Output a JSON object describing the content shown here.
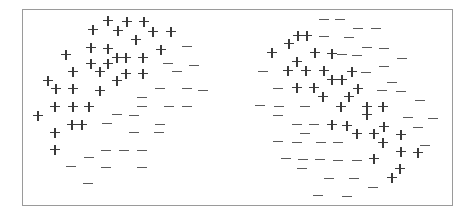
{
  "figure": {
    "frame": {
      "x": 22,
      "y": 9,
      "width": 431,
      "height": 197
    },
    "colors": {
      "border": "#9a9a9a",
      "plus": "#3a3a3a",
      "minus": "#5a5a5a"
    },
    "panels": [
      {
        "name": "left-cluster",
        "description": "Positive and negative examples separable by a roughly linear boundary",
        "points": [
          {
            "x": 108,
            "y": 21,
            "label": "+"
          },
          {
            "x": 127,
            "y": 22,
            "label": "+"
          },
          {
            "x": 144,
            "y": 22,
            "label": "+"
          },
          {
            "x": 93,
            "y": 30,
            "label": "+"
          },
          {
            "x": 118,
            "y": 31,
            "label": "+"
          },
          {
            "x": 153,
            "y": 32,
            "label": "+"
          },
          {
            "x": 171,
            "y": 32,
            "label": "+"
          },
          {
            "x": 136,
            "y": 40,
            "label": "+"
          },
          {
            "x": 91,
            "y": 48,
            "label": "+"
          },
          {
            "x": 108,
            "y": 49,
            "label": "+"
          },
          {
            "x": 161,
            "y": 50,
            "label": "+"
          },
          {
            "x": 66,
            "y": 55,
            "label": "+"
          },
          {
            "x": 117,
            "y": 58,
            "label": "+"
          },
          {
            "x": 126,
            "y": 58,
            "label": "+"
          },
          {
            "x": 143,
            "y": 58,
            "label": "+"
          },
          {
            "x": 91,
            "y": 64,
            "label": "+"
          },
          {
            "x": 108,
            "y": 64,
            "label": "+"
          },
          {
            "x": 73,
            "y": 72,
            "label": "+"
          },
          {
            "x": 100,
            "y": 72,
            "label": "+"
          },
          {
            "x": 126,
            "y": 74,
            "label": "+"
          },
          {
            "x": 143,
            "y": 74,
            "label": "+"
          },
          {
            "x": 48,
            "y": 81,
            "label": "+"
          },
          {
            "x": 117,
            "y": 81,
            "label": "+"
          },
          {
            "x": 56,
            "y": 89,
            "label": "+"
          },
          {
            "x": 73,
            "y": 89,
            "label": "+"
          },
          {
            "x": 100,
            "y": 91,
            "label": "+"
          },
          {
            "x": 55,
            "y": 107,
            "label": "+"
          },
          {
            "x": 73,
            "y": 107,
            "label": "+"
          },
          {
            "x": 89,
            "y": 107,
            "label": "+"
          },
          {
            "x": 38,
            "y": 116,
            "label": "+"
          },
          {
            "x": 72,
            "y": 125,
            "label": "+"
          },
          {
            "x": 82,
            "y": 125,
            "label": "+"
          },
          {
            "x": 55,
            "y": 133,
            "label": "+"
          },
          {
            "x": 55,
            "y": 150,
            "label": "+"
          },
          {
            "x": 187,
            "y": 47,
            "label": "-"
          },
          {
            "x": 168,
            "y": 64,
            "label": "-"
          },
          {
            "x": 194,
            "y": 66,
            "label": "-"
          },
          {
            "x": 177,
            "y": 72,
            "label": "-"
          },
          {
            "x": 160,
            "y": 89,
            "label": "-"
          },
          {
            "x": 187,
            "y": 89,
            "label": "-"
          },
          {
            "x": 203,
            "y": 91,
            "label": "-"
          },
          {
            "x": 142,
            "y": 98,
            "label": "-"
          },
          {
            "x": 142,
            "y": 107,
            "label": "-"
          },
          {
            "x": 169,
            "y": 107,
            "label": "-"
          },
          {
            "x": 187,
            "y": 107,
            "label": "-"
          },
          {
            "x": 117,
            "y": 115,
            "label": "-"
          },
          {
            "x": 134,
            "y": 116,
            "label": "-"
          },
          {
            "x": 107,
            "y": 124,
            "label": "-"
          },
          {
            "x": 160,
            "y": 125,
            "label": "-"
          },
          {
            "x": 134,
            "y": 133,
            "label": "-"
          },
          {
            "x": 159,
            "y": 133,
            "label": "-"
          },
          {
            "x": 106,
            "y": 151,
            "label": "-"
          },
          {
            "x": 124,
            "y": 151,
            "label": "-"
          },
          {
            "x": 142,
            "y": 151,
            "label": "-"
          },
          {
            "x": 89,
            "y": 158,
            "label": "-"
          },
          {
            "x": 71,
            "y": 167,
            "label": "-"
          },
          {
            "x": 106,
            "y": 168,
            "label": "-"
          },
          {
            "x": 142,
            "y": 168,
            "label": "-"
          },
          {
            "x": 88,
            "y": 184,
            "label": "-"
          }
        ]
      },
      {
        "name": "right-cluster",
        "description": "Positive and negative examples interleaved, not linearly separable",
        "points": [
          {
            "x": 324,
            "y": 20,
            "label": "-"
          },
          {
            "x": 340,
            "y": 20,
            "label": "-"
          },
          {
            "x": 358,
            "y": 29,
            "label": "-"
          },
          {
            "x": 376,
            "y": 29,
            "label": "-"
          },
          {
            "x": 324,
            "y": 37,
            "label": "-"
          },
          {
            "x": 349,
            "y": 38,
            "label": "-"
          },
          {
            "x": 367,
            "y": 48,
            "label": "-"
          },
          {
            "x": 384,
            "y": 49,
            "label": "-"
          },
          {
            "x": 342,
            "y": 55,
            "label": "-"
          },
          {
            "x": 357,
            "y": 56,
            "label": "-"
          },
          {
            "x": 402,
            "y": 59,
            "label": "-"
          },
          {
            "x": 263,
            "y": 72,
            "label": "-"
          },
          {
            "x": 384,
            "y": 67,
            "label": "-"
          },
          {
            "x": 366,
            "y": 73,
            "label": "-"
          },
          {
            "x": 392,
            "y": 83,
            "label": "-"
          },
          {
            "x": 278,
            "y": 89,
            "label": "-"
          },
          {
            "x": 382,
            "y": 91,
            "label": "-"
          },
          {
            "x": 401,
            "y": 92,
            "label": "-"
          },
          {
            "x": 420,
            "y": 101,
            "label": "-"
          },
          {
            "x": 260,
            "y": 106,
            "label": "-"
          },
          {
            "x": 279,
            "y": 107,
            "label": "-"
          },
          {
            "x": 305,
            "y": 107,
            "label": "-"
          },
          {
            "x": 278,
            "y": 116,
            "label": "-"
          },
          {
            "x": 408,
            "y": 118,
            "label": "-"
          },
          {
            "x": 433,
            "y": 119,
            "label": "-"
          },
          {
            "x": 297,
            "y": 125,
            "label": "-"
          },
          {
            "x": 314,
            "y": 125,
            "label": "-"
          },
          {
            "x": 418,
            "y": 128,
            "label": "-"
          },
          {
            "x": 305,
            "y": 134,
            "label": "-"
          },
          {
            "x": 278,
            "y": 142,
            "label": "-"
          },
          {
            "x": 297,
            "y": 143,
            "label": "-"
          },
          {
            "x": 321,
            "y": 143,
            "label": "-"
          },
          {
            "x": 338,
            "y": 143,
            "label": "-"
          },
          {
            "x": 425,
            "y": 146,
            "label": "-"
          },
          {
            "x": 286,
            "y": 159,
            "label": "-"
          },
          {
            "x": 303,
            "y": 160,
            "label": "-"
          },
          {
            "x": 320,
            "y": 160,
            "label": "-"
          },
          {
            "x": 338,
            "y": 161,
            "label": "-"
          },
          {
            "x": 357,
            "y": 161,
            "label": "-"
          },
          {
            "x": 302,
            "y": 169,
            "label": "-"
          },
          {
            "x": 329,
            "y": 179,
            "label": "-"
          },
          {
            "x": 354,
            "y": 179,
            "label": "-"
          },
          {
            "x": 373,
            "y": 188,
            "label": "-"
          },
          {
            "x": 318,
            "y": 196,
            "label": "-"
          },
          {
            "x": 347,
            "y": 197,
            "label": "-"
          },
          {
            "x": 298,
            "y": 36,
            "label": "+"
          },
          {
            "x": 307,
            "y": 36,
            "label": "+"
          },
          {
            "x": 289,
            "y": 44,
            "label": "+"
          },
          {
            "x": 272,
            "y": 53,
            "label": "+"
          },
          {
            "x": 315,
            "y": 53,
            "label": "+"
          },
          {
            "x": 332,
            "y": 54,
            "label": "+"
          },
          {
            "x": 297,
            "y": 62,
            "label": "+"
          },
          {
            "x": 288,
            "y": 71,
            "label": "+"
          },
          {
            "x": 306,
            "y": 71,
            "label": "+"
          },
          {
            "x": 324,
            "y": 71,
            "label": "+"
          },
          {
            "x": 352,
            "y": 72,
            "label": "+"
          },
          {
            "x": 332,
            "y": 80,
            "label": "+"
          },
          {
            "x": 342,
            "y": 80,
            "label": "+"
          },
          {
            "x": 297,
            "y": 88,
            "label": "+"
          },
          {
            "x": 314,
            "y": 88,
            "label": "+"
          },
          {
            "x": 358,
            "y": 89,
            "label": "+"
          },
          {
            "x": 323,
            "y": 97,
            "label": "+"
          },
          {
            "x": 349,
            "y": 97,
            "label": "+"
          },
          {
            "x": 341,
            "y": 107,
            "label": "+"
          },
          {
            "x": 367,
            "y": 107,
            "label": "+"
          },
          {
            "x": 383,
            "y": 107,
            "label": "+"
          },
          {
            "x": 367,
            "y": 115,
            "label": "+"
          },
          {
            "x": 332,
            "y": 125,
            "label": "+"
          },
          {
            "x": 347,
            "y": 126,
            "label": "+"
          },
          {
            "x": 384,
            "y": 127,
            "label": "+"
          },
          {
            "x": 357,
            "y": 134,
            "label": "+"
          },
          {
            "x": 374,
            "y": 134,
            "label": "+"
          },
          {
            "x": 401,
            "y": 135,
            "label": "+"
          },
          {
            "x": 383,
            "y": 143,
            "label": "+"
          },
          {
            "x": 401,
            "y": 152,
            "label": "+"
          },
          {
            "x": 418,
            "y": 153,
            "label": "+"
          },
          {
            "x": 374,
            "y": 159,
            "label": "+"
          },
          {
            "x": 400,
            "y": 169,
            "label": "+"
          },
          {
            "x": 392,
            "y": 178,
            "label": "+"
          }
        ]
      }
    ]
  }
}
